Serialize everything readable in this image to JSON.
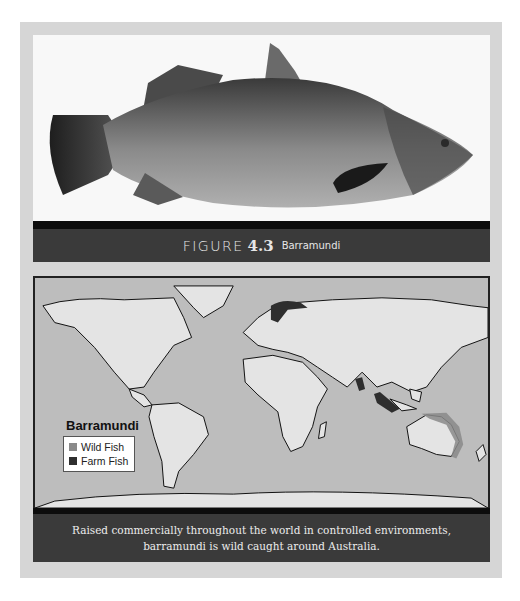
{
  "figure": {
    "label": "FIGURE",
    "number": "4.3",
    "name": "Barramundi"
  },
  "photo": {
    "subject": "Barramundi fish, side view"
  },
  "map": {
    "legend_title": "Barramundi",
    "legend": [
      {
        "label": "Wild Fish",
        "color": "#8a8a8a"
      },
      {
        "label": "Farm Fish",
        "color": "#2e2e2e"
      }
    ],
    "caption": "Raised commercially throughout the world in controlled environments, barramundi is wild caught around Australia."
  },
  "colors": {
    "frame": "#d6d6d6",
    "caption_bar": "#3a3a3a",
    "ocean": "#bdbdbd",
    "land": "#e4e4e4"
  }
}
